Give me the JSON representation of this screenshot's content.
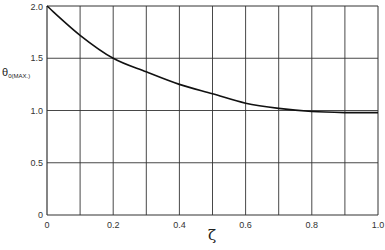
{
  "chart_data": {
    "type": "line",
    "title": "",
    "xlabel": "ζ",
    "ylabel": "θ0(MAX.)",
    "ylabel_main": "θ",
    "ylabel_sub": "0(MAX.)",
    "xlim": [
      0,
      1.0
    ],
    "ylim": [
      0,
      2.0
    ],
    "grid": true,
    "x_grid_step": 0.1,
    "y_grid_step": 0.5,
    "x_ticks": [
      0,
      0.2,
      0.4,
      0.6,
      0.8,
      1.0
    ],
    "x_tick_labels": [
      "0",
      "0.2",
      "0.4",
      "0.6",
      "0.8",
      "1.0"
    ],
    "y_ticks": [
      0,
      0.5,
      1.0,
      1.5,
      2.0
    ],
    "y_tick_labels": [
      "0",
      "0.5",
      "1.0",
      "1.5",
      "2.0"
    ],
    "series": [
      {
        "name": "θ0(MAX.) vs ζ",
        "x": [
          0,
          0.1,
          0.2,
          0.3,
          0.4,
          0.5,
          0.6,
          0.7,
          0.8,
          0.9,
          1.0
        ],
        "values": [
          2.0,
          1.72,
          1.5,
          1.37,
          1.25,
          1.16,
          1.07,
          1.02,
          0.99,
          0.98,
          0.98
        ]
      }
    ],
    "legend": null
  }
}
